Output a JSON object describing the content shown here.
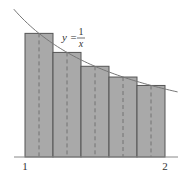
{
  "diagram": {
    "function_label": {
      "lhs": "y =",
      "numerator": "1",
      "denominator": "x"
    },
    "x_ticks": [
      {
        "value": 1,
        "label": "1"
      },
      {
        "value": 2,
        "label": "2"
      }
    ],
    "interval": [
      1,
      2
    ],
    "n_rectangles": 5,
    "midpoints": [
      1.1,
      1.3,
      1.5,
      1.7,
      1.9
    ],
    "heights": [
      0.909,
      0.769,
      0.667,
      0.588,
      0.526
    ],
    "colors": {
      "rect_fill": "#a9a9a9",
      "rect_stroke": "#555555",
      "curve": "#777777",
      "axis": "#888888",
      "text": "#333333"
    }
  }
}
